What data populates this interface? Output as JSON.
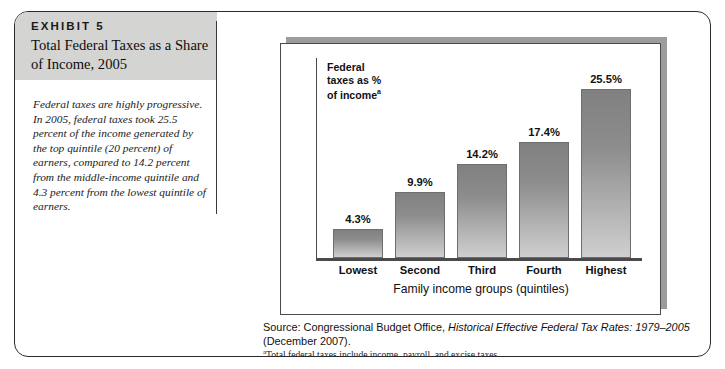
{
  "exhibit": {
    "label": "EXHIBIT 5",
    "title": "Total Federal Taxes as a Share of Income, 2005",
    "caption": "Federal taxes are highly progressive. In 2005, federal taxes took 25.5 percent of the income generated by the top quintile (20 percent) of earners, compared to 14.2 percent from the middle-income quintile and 4.3 percent from the lowest quintile of earners.",
    "header_band_color": "#d4d4d2"
  },
  "notes": {
    "source_prefix": "Source: Congressional Budget Office, ",
    "source_title_italic": "Historical Effective Federal Tax Rates: 1979–2005",
    "source_suffix": " (December 2007).",
    "footnote_marker": "a",
    "footnote_text": "Total federal taxes include income, payroll, and excise taxes."
  },
  "chart_data": {
    "type": "bar",
    "title": "",
    "categories": [
      "Lowest",
      "Second",
      "Third",
      "Fourth",
      "Highest"
    ],
    "values": [
      4.3,
      9.9,
      14.2,
      17.4,
      25.5
    ],
    "data_labels": [
      "4.3%",
      "9.9%",
      "14.2%",
      "17.4%",
      "25.5%"
    ],
    "xlabel": "Family income groups (quintiles)",
    "ylabel": "Federal taxes as % of income",
    "ylabel_superscript": "a",
    "ylim": [
      0,
      28
    ],
    "grid": false,
    "legend": false,
    "bar_color_top": "#808080",
    "bar_color_bottom": "#cfcfcf"
  }
}
